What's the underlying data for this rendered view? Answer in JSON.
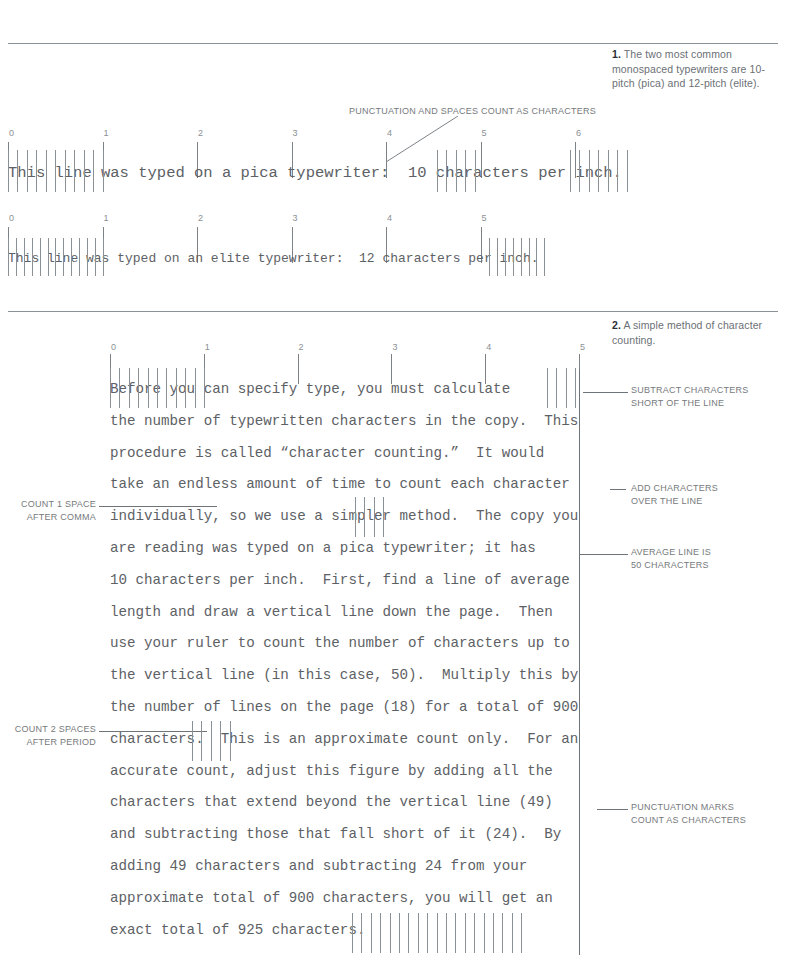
{
  "page": {
    "width": 787,
    "height": 966,
    "background": "#ffffff",
    "ink": "#5d6165",
    "rule_color": "#8c9196"
  },
  "captions": [
    {
      "number": "1.",
      "text": "The two most common monospaced typewriters are 10-pitch (pica) and 12-pitch (elite)."
    },
    {
      "number": "2.",
      "text": "A simple method of character counting."
    }
  ],
  "figure1": {
    "callout": "PUNCTUATION AND SPACES COUNT AS CHARACTERS",
    "pica": {
      "ruler_numbers": [
        "0",
        "1",
        "2",
        "3",
        "4",
        "5",
        "6"
      ],
      "text": "This line was typed on a pica typewriter:  10 characters per inch."
    },
    "elite": {
      "ruler_numbers": [
        "0",
        "1",
        "2",
        "3",
        "4",
        "5"
      ],
      "text": "This line was typed on an elite typewriter:  12 characters per inch."
    }
  },
  "figure2": {
    "ruler_numbers": [
      "0",
      "1",
      "2",
      "3",
      "4",
      "5"
    ],
    "annotations_right": [
      {
        "line1": "SUBTRACT CHARACTERS",
        "line2": "SHORT OF THE LINE"
      },
      {
        "line1": "ADD CHARACTERS",
        "line2": "OVER THE LINE"
      },
      {
        "line1": "AVERAGE LINE IS",
        "line2": "50 CHARACTERS"
      },
      {
        "line1": "PUNCTUATION MARKS",
        "line2": "COUNT AS CHARACTERS"
      }
    ],
    "annotations_left": [
      {
        "line1": "COUNT 1 SPACE",
        "line2": "AFTER COMMA"
      },
      {
        "line1": "COUNT 2 SPACES",
        "line2": "AFTER PERIOD"
      }
    ],
    "body_lines": [
      "Before you can specify type, you must calculate",
      "the number of typewritten characters in the copy.  This",
      "procedure is called “character counting.”  It would",
      "take an endless amount of time to count each character",
      "individually, so we use a simpler method.  The copy you",
      "are reading was typed on a pica typewriter; it has",
      "10 characters per inch.  First, find a line of average",
      "length and draw a vertical line down the page.  Then",
      "use your ruler to count the number of characters up to",
      "the vertical line (in this case, 50).  Multiply this by",
      "the number of lines on the page (18) for a total of 900",
      "characters.  This is an approximate count only.  For an",
      "accurate count, adjust this figure by adding all the",
      "characters that extend beyond the vertical line (49)",
      "and subtracting those that fall short of it (24).  By",
      "adding 49 characters and subtracting 24 from your",
      "approximate total of 900 characters, you will get an",
      "exact total of 925 characters."
    ]
  }
}
